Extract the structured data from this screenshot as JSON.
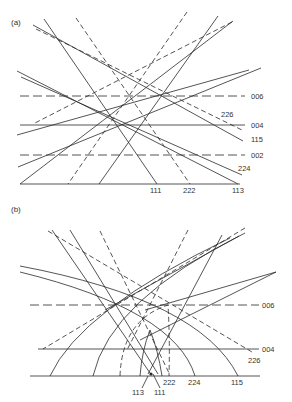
{
  "panels": [
    {
      "id": "a",
      "label": "(a)",
      "label_pos": [
        11,
        25
      ],
      "baseline": {
        "x1": 20,
        "x2": 240,
        "y": 184
      },
      "horizontal_lines": [
        {
          "name": "006",
          "y": 96,
          "x1": 20,
          "x2": 245,
          "style": "longdash",
          "label": "006",
          "label_x": 251
        },
        {
          "name": "004",
          "y": 125,
          "x1": 20,
          "x2": 245,
          "style": "solid",
          "label": "004",
          "label_x": 251
        },
        {
          "name": "002",
          "y": 155,
          "x1": 20,
          "x2": 245,
          "style": "longdash",
          "label": "002",
          "label_x": 251
        }
      ],
      "lines": [
        {
          "x1": 33,
          "y1": 25,
          "x2": 243,
          "y2": 141,
          "style": "solid"
        },
        {
          "x1": 44,
          "y1": 19,
          "x2": 157,
          "y2": 184,
          "style": "solid"
        },
        {
          "x1": 76,
          "y1": 18,
          "x2": 190,
          "y2": 184,
          "style": "dash"
        },
        {
          "x1": 36,
          "y1": 29,
          "x2": 242,
          "y2": 130,
          "style": "dash"
        },
        {
          "x1": 17,
          "y1": 71,
          "x2": 238,
          "y2": 184,
          "style": "solid"
        },
        {
          "x1": 21,
          "y1": 77,
          "x2": 242,
          "y2": 175,
          "style": "solid"
        },
        {
          "x1": 187,
          "y1": 12,
          "x2": 68,
          "y2": 184,
          "style": "dash"
        },
        {
          "x1": 218,
          "y1": 16,
          "x2": 99,
          "y2": 184,
          "style": "solid"
        },
        {
          "x1": 233,
          "y1": 21,
          "x2": 20,
          "y2": 184,
          "style": "solid"
        },
        {
          "x1": 232,
          "y1": 22,
          "x2": 35,
          "y2": 123,
          "style": "dash"
        },
        {
          "x1": 249,
          "y1": 70,
          "x2": 17,
          "y2": 135,
          "style": "solid"
        },
        {
          "x1": 261,
          "y1": 68,
          "x2": 18,
          "y2": 167,
          "style": "solid"
        }
      ],
      "labels": [
        {
          "text": "006",
          "x": 251,
          "y": 99
        },
        {
          "text": "226",
          "x": 221,
          "y": 117
        },
        {
          "text": "004",
          "x": 251,
          "y": 128
        },
        {
          "text": "115",
          "x": 251,
          "y": 142
        },
        {
          "text": "002",
          "x": 251,
          "y": 158
        },
        {
          "text": "224",
          "x": 238,
          "y": 171
        },
        {
          "text": "111",
          "x": 150,
          "y": 193
        },
        {
          "text": "222",
          "x": 183,
          "y": 193
        },
        {
          "text": "113",
          "x": 232,
          "y": 193
        }
      ]
    },
    {
      "id": "b",
      "label": "(b)",
      "label_pos": [
        11,
        212
      ],
      "baseline": {
        "x1": 30,
        "x2": 260,
        "y": 376
      },
      "horizontal_lines": [
        {
          "name": "006",
          "y": 305,
          "x1": 30,
          "x2": 259,
          "style": "longdash",
          "label": "006",
          "label_x": 262
        },
        {
          "name": "004",
          "y": 349,
          "x1": 38,
          "x2": 259,
          "style": "solid",
          "label": "004",
          "label_x": 262
        }
      ],
      "lines": [
        {
          "x1": 48,
          "y1": 231,
          "x2": 252,
          "y2": 352,
          "style": "dash"
        },
        {
          "x1": 52,
          "y1": 230,
          "x2": 150,
          "y2": 373,
          "style": "solid"
        },
        {
          "x1": 70,
          "y1": 230,
          "x2": 158,
          "y2": 374,
          "style": "solid"
        },
        {
          "x1": 100,
          "y1": 231,
          "x2": 170,
          "y2": 375,
          "style": "dash"
        },
        {
          "x1": 188,
          "y1": 230,
          "x2": 127,
          "y2": 350,
          "style": "dash"
        },
        {
          "x1": 222,
          "y1": 235,
          "x2": 148,
          "y2": 374,
          "style": "solid"
        },
        {
          "x1": 245,
          "y1": 228,
          "x2": 43,
          "y2": 349,
          "style": "dash"
        },
        {
          "x1": 239,
          "y1": 236,
          "x2": 105,
          "y2": 310,
          "style": "solid"
        },
        {
          "x1": 276,
          "y1": 272,
          "x2": 145,
          "y2": 310,
          "style": "solid"
        },
        {
          "x1": 276,
          "y1": 272,
          "x2": 140,
          "y2": 340,
          "style": "solid"
        }
      ],
      "arcs": [
        {
          "name": "115",
          "d": "M 20 266 Q 200 300 238 376",
          "style": "solid"
        },
        {
          "name": "224",
          "d": "M 20 272 Q 175 310 195 376",
          "style": "solid"
        },
        {
          "name": "115-left",
          "d": "M 50 376 Q 80 310 230 238",
          "style": "solid"
        },
        {
          "name": "224-left",
          "d": "M 93 376 Q 110 300 245 233",
          "style": "solid"
        },
        {
          "name": "222",
          "d": "M 120 376 Q 122 320 168 305 Q 170 340 169 376",
          "style": "dash"
        },
        {
          "name": "113",
          "d": "M 140 376 Q 142 350 150 330 Q 158 350 162 376",
          "style": "solid"
        }
      ],
      "labels": [
        {
          "text": "006",
          "x": 262,
          "y": 308
        },
        {
          "text": "004",
          "x": 262,
          "y": 352
        },
        {
          "text": "226",
          "x": 248,
          "y": 363
        },
        {
          "text": "222",
          "x": 163,
          "y": 385
        },
        {
          "text": "224",
          "x": 188,
          "y": 385
        },
        {
          "text": "115",
          "x": 231,
          "y": 385
        },
        {
          "text": "113",
          "x": 132,
          "y": 395
        },
        {
          "text": "111",
          "x": 154,
          "y": 395
        }
      ],
      "leaders": [
        {
          "x1": 148,
          "y1": 376,
          "x2": 142,
          "y2": 388
        },
        {
          "x1": 153,
          "y1": 374,
          "x2": 160,
          "y2": 388
        }
      ]
    }
  ]
}
